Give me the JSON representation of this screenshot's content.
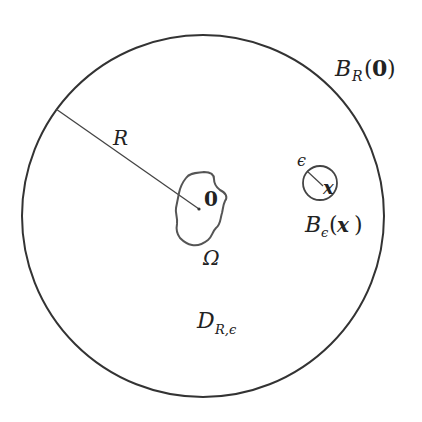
{
  "diagram": {
    "outer_ball": {
      "label_main": "B",
      "label_sub": "R",
      "label_arg_open": "(",
      "label_arg": "0",
      "label_arg_close": ")"
    },
    "radius_label": "R",
    "domain_omega": {
      "label": "Ω",
      "origin_label": "0"
    },
    "small_ball": {
      "label_main": "B",
      "label_sub": "ϵ",
      "label_arg_open": "(",
      "label_arg": "x",
      "label_arg_close": ")",
      "radius_label": "ϵ",
      "center_label": "x"
    },
    "region": {
      "label_main": "D",
      "label_sub": "R,ϵ"
    },
    "colors": {
      "stroke": "#333333",
      "blob_stroke": "#444444",
      "text": "#222222"
    }
  }
}
